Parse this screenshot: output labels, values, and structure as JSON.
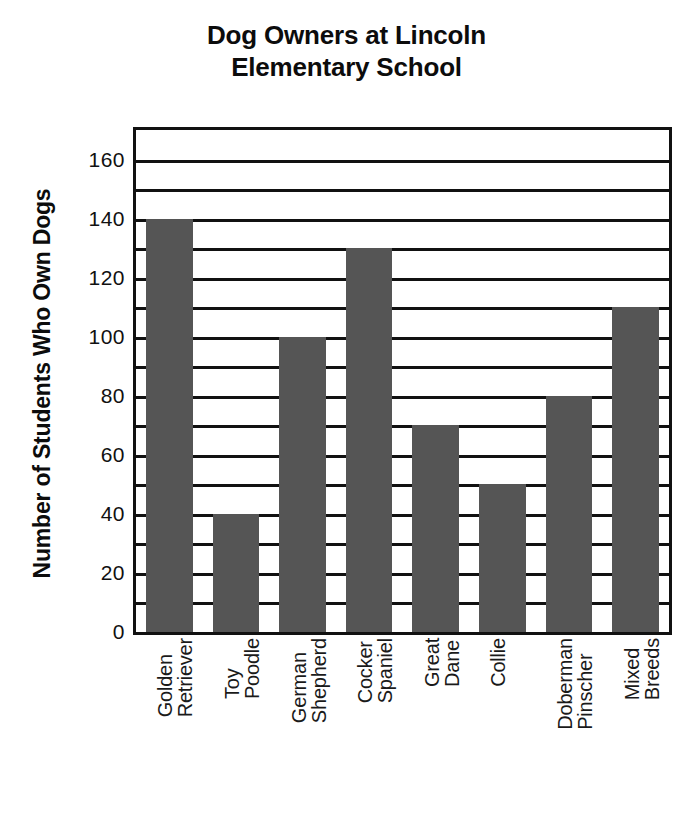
{
  "chart_data": {
    "type": "bar",
    "title": "Dog Owners at Lincoln\nElementary School",
    "xlabel": "",
    "ylabel": "Number of Students Who Own Dogs",
    "categories": [
      "Golden\nRetriever",
      "Toy\nPoodle",
      "German\nShepherd",
      "Cocker\nSpaniel",
      "Great\nDane",
      "Collie",
      "Doberman\nPinscher",
      "Mixed\nBreeds"
    ],
    "values": [
      140,
      40,
      100,
      130,
      70,
      50,
      80,
      110
    ],
    "ylim": [
      0,
      170
    ],
    "ytick_labels": [
      "0",
      "20",
      "40",
      "60",
      "80",
      "100",
      "120",
      "140",
      "160"
    ],
    "ytick_values": [
      0,
      20,
      40,
      60,
      80,
      100,
      120,
      140,
      160
    ],
    "gridline_values": [
      10,
      20,
      30,
      40,
      50,
      60,
      70,
      80,
      90,
      100,
      110,
      120,
      130,
      140,
      150,
      160,
      170
    ],
    "grid": true,
    "legend": "none",
    "bar_color": "#555555",
    "axis_color": "#111111",
    "background_color": "#ffffff"
  }
}
